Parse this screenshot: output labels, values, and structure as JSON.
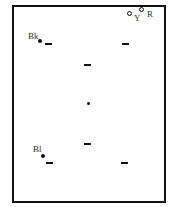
{
  "diagram": {
    "labels": {
      "black": "Bk",
      "blue": "Bl",
      "yellow": "Y",
      "red": "R"
    },
    "colors": {
      "ink": "#111111",
      "label": "#333333",
      "background": "#ffffff"
    }
  }
}
